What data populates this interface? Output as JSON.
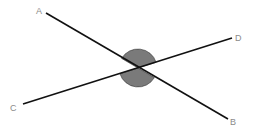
{
  "diagram": {
    "intersection": {
      "x": 138,
      "y": 68
    },
    "lines": [
      {
        "name": "AB",
        "from": {
          "label": "A",
          "x": 46,
          "y": 13
        },
        "to": {
          "label": "B",
          "x": 228,
          "y": 119
        }
      },
      {
        "name": "CD",
        "from": {
          "label": "C",
          "x": 23,
          "y": 104
        },
        "to": {
          "label": "D",
          "x": 232,
          "y": 38
        }
      }
    ],
    "labels": {
      "A": {
        "text": "A",
        "x": 36,
        "y": 14
      },
      "B": {
        "text": "B",
        "x": 230,
        "y": 125
      },
      "C": {
        "text": "C",
        "x": 10,
        "y": 111
      },
      "D": {
        "text": "D",
        "x": 235,
        "y": 41
      }
    },
    "shaded_angles": [
      "AOD",
      "COB"
    ],
    "colors": {
      "line": "#111111",
      "fill": "#7a7a7a",
      "label": "#8a8a8a"
    }
  }
}
